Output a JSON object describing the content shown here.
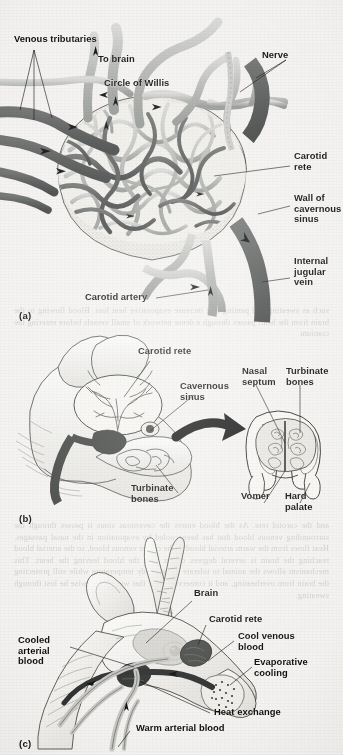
{
  "figure": {
    "domain": "scanned-textbook-figure",
    "page_background": "#f3f2f0",
    "ink_color": "#0d0d0d"
  },
  "colors": {
    "artery_light": "#b9bbb8",
    "vein_dark": "#585b5a",
    "sinus_wall": "#e9e8e4",
    "outline": "#2a2a2a",
    "label_text": "#0d0d0d",
    "showthrough_text": "#b9b6b1"
  },
  "panels": [
    {
      "id": "a",
      "id_label": "(a)",
      "title": "Carotid rete within the cavernous sinus",
      "labels": [
        {
          "name": "venous-tributaries",
          "text": "Venous tributaries",
          "x": 14,
          "y": 40,
          "align": "left"
        },
        {
          "name": "to-brain",
          "text": "To brain",
          "x": 98,
          "y": 60,
          "align": "left"
        },
        {
          "name": "circle-of-willis",
          "text": "Circle of Willis",
          "x": 104,
          "y": 84,
          "align": "left"
        },
        {
          "name": "nerve",
          "text": "Nerve",
          "x": 262,
          "y": 56,
          "align": "left"
        },
        {
          "name": "carotid-rete",
          "text": "Carotid\nrete",
          "x": 292,
          "y": 157,
          "align": "left"
        },
        {
          "name": "wall-of-cavernous-sinus",
          "text": "Wall of\ncavernous\nsinus",
          "x": 292,
          "y": 199,
          "align": "left"
        },
        {
          "name": "internal-jugular-vein",
          "text": "Internal\njugular\nvein",
          "x": 292,
          "y": 262,
          "align": "left"
        },
        {
          "name": "carotid-artery",
          "text": "Carotid artery",
          "x": 85,
          "y": 296,
          "align": "left"
        }
      ],
      "flow_arrows": 9
    },
    {
      "id": "b",
      "id_label": "(b)",
      "title": "Head of antelope showing carotid rete, cavernous sinus, turbinate bones and nasal cross-section",
      "labels": [
        {
          "name": "carotid-rete",
          "text": "Carotid rete",
          "x": 138,
          "y": 352,
          "align": "left"
        },
        {
          "name": "cavernous-sinus",
          "text": "Cavernous\nsinus",
          "x": 180,
          "y": 387,
          "align": "left"
        },
        {
          "name": "nasal-septum",
          "text": "Nasal\nseptum",
          "x": 242,
          "y": 372,
          "align": "left"
        },
        {
          "name": "turbinate-bones-right",
          "text": "Turbinate\nbones",
          "x": 288,
          "y": 372,
          "align": "left"
        },
        {
          "name": "turbinate-bones-left",
          "text": "Turbinate\nbones",
          "x": 131,
          "y": 489,
          "align": "left"
        },
        {
          "name": "vomer",
          "text": "Vomer",
          "x": 243,
          "y": 497,
          "align": "left"
        },
        {
          "name": "hard-palate",
          "text": "Hard\npalate",
          "x": 285,
          "y": 497,
          "align": "left"
        }
      ]
    },
    {
      "id": "c",
      "id_label": "(c)",
      "title": "Heat exchange and evaporative cooling in the antelope head",
      "labels": [
        {
          "name": "brain",
          "text": "Brain",
          "x": 194,
          "y": 594,
          "align": "left"
        },
        {
          "name": "carotid-rete",
          "text": "Carotid rete",
          "x": 209,
          "y": 620,
          "align": "left"
        },
        {
          "name": "cool-venous-blood",
          "text": "Cool venous\nblood",
          "x": 238,
          "y": 637,
          "align": "left"
        },
        {
          "name": "evaporative-cooling",
          "text": "Evaporative\ncooling",
          "x": 255,
          "y": 663,
          "align": "left"
        },
        {
          "name": "cooled-arterial-blood",
          "text": "Cooled\narterial\nblood",
          "x": 18,
          "y": 641,
          "align": "left"
        },
        {
          "name": "heat-exchange",
          "text": "Heat exchange",
          "x": 214,
          "y": 713,
          "align": "left"
        },
        {
          "name": "warm-arterial-blood",
          "text": "Warm arterial blood",
          "x": 136,
          "y": 729,
          "align": "left"
        }
      ]
    }
  ],
  "showthrough": {
    "blocks": [
      {
        "name": "showthrough-block-1",
        "top": 305,
        "text": "such as sweating and panting that increase evaporative heat loss. Blood flowing to the brain from the heart passes through a dense network of small vessels before entering the cranium"
      },
      {
        "name": "showthrough-block-2",
        "top": 520,
        "text": "and the carotid rete. As the blood enters the cavernous sinus it passes through the surrounding venous blood that has been cooled by evaporation in the nasal passages. Heat flows from the warm arterial blood to the cooler venous blood, so the arterial blood reaching the brain is several degrees cooler than the blood leaving the heart. This mechanism allows the animal to tolerate a high body temperature while still protecting the brain from overheating, and it conserves water that would otherwise be lost through sweating."
      }
    ]
  }
}
